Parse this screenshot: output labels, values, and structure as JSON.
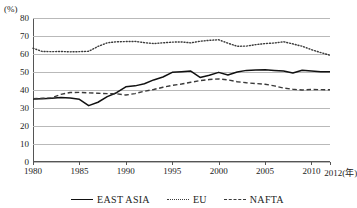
{
  "chart_data": {
    "type": "line",
    "title": "",
    "xlabel": "",
    "ylabel": "(%)",
    "xlim": [
      1980,
      2012
    ],
    "ylim": [
      0,
      80
    ],
    "grid": true,
    "legend_position": "bottom",
    "y_unit_label": "(%)",
    "y_ticks": [
      "80",
      "70",
      "60",
      "50",
      "40",
      "30",
      "20",
      "10",
      "0"
    ],
    "y_tick_values": [
      80,
      70,
      60,
      50,
      40,
      30,
      20,
      10,
      0
    ],
    "x_ticks": [
      {
        "label": "1980",
        "value": 1980
      },
      {
        "label": "1985",
        "value": 1985
      },
      {
        "label": "1990",
        "value": 1990
      },
      {
        "label": "1995",
        "value": 1995
      },
      {
        "label": "2000",
        "value": 2000
      },
      {
        "label": "2005",
        "value": 2005
      },
      {
        "label": "2010",
        "value": 2010
      },
      {
        "label": "2012(年)",
        "value": 2012
      }
    ],
    "x": [
      1980,
      1981,
      1982,
      1983,
      1984,
      1985,
      1986,
      1987,
      1988,
      1989,
      1990,
      1991,
      1992,
      1993,
      1994,
      1995,
      1996,
      1997,
      1998,
      1999,
      2000,
      2001,
      2002,
      2003,
      2004,
      2005,
      2006,
      2007,
      2008,
      2009,
      2010,
      2011,
      2012
    ],
    "series": [
      {
        "name": "EAST ASIA",
        "style": "solid",
        "color": "#111111",
        "values": [
          35.0,
          35.2,
          35.4,
          35.8,
          35.6,
          34.8,
          31.3,
          33.2,
          36.3,
          38.5,
          41.8,
          42.3,
          43.5,
          45.6,
          47.2,
          49.8,
          50.2,
          50.5,
          47.0,
          48.2,
          49.8,
          48.3,
          50.0,
          50.9,
          51.1,
          51.2,
          50.9,
          50.6,
          49.4,
          51.0,
          50.6,
          50.2,
          50.1
        ]
      },
      {
        "name": "EU",
        "style": "dotted",
        "color": "#3a3a3a",
        "values": [
          63.2,
          61.4,
          61.3,
          61.4,
          61.2,
          61.3,
          61.5,
          64.2,
          66.2,
          66.8,
          66.9,
          67.0,
          66.3,
          65.8,
          66.2,
          66.6,
          66.7,
          66.2,
          67.1,
          67.6,
          67.9,
          66.0,
          64.3,
          64.4,
          65.2,
          65.8,
          66.1,
          66.8,
          65.6,
          64.3,
          62.4,
          60.8,
          59.3
        ]
      },
      {
        "name": "NAFTA",
        "style": "dashed",
        "color": "#3a3a3a",
        "values": [
          35.2,
          35.4,
          35.6,
          37.6,
          38.6,
          38.7,
          38.4,
          38.2,
          38.0,
          37.9,
          37.2,
          38.0,
          39.3,
          40.3,
          41.5,
          42.6,
          43.3,
          44.3,
          45.2,
          45.8,
          46.2,
          45.6,
          44.6,
          44.0,
          43.6,
          43.2,
          42.3,
          41.1,
          40.4,
          40.0,
          40.3,
          40.2,
          40.1
        ]
      }
    ],
    "legend": [
      {
        "label": "EAST ASIA",
        "style": "solid"
      },
      {
        "label": "EU",
        "style": "dotted"
      },
      {
        "label": "NAFTA",
        "style": "dashed"
      }
    ]
  }
}
